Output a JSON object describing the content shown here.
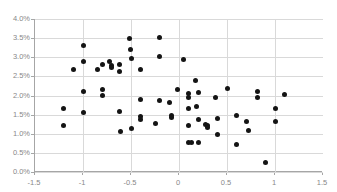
{
  "chart_data": {
    "type": "scatter",
    "title": "",
    "xlabel": "",
    "ylabel": "",
    "xlim": [
      -1.5,
      1.5
    ],
    "ylim": [
      0.0,
      4.0
    ],
    "grid": true,
    "legend": null,
    "y_unit": "%",
    "xticks": [
      -1.5,
      -1,
      -0.5,
      0,
      0.5,
      1,
      1.5
    ],
    "xtick_labels": [
      "-1.5",
      "-1",
      "-0.5",
      "0",
      "0.5",
      "1",
      "1.5"
    ],
    "yticks": [
      0.0,
      0.5,
      1.0,
      1.5,
      2.0,
      2.5,
      3.0,
      3.5,
      4.0
    ],
    "ytick_labels": [
      "0.0%",
      "0.5%",
      "1.0%",
      "1.5%",
      "2.0%",
      "2.5%",
      "3.0%",
      "3.5%",
      "4.0%"
    ],
    "marker": "circle",
    "marker_color": "#141414",
    "grid_color": "#d9d9d9",
    "axis_color": "#a6a6a6",
    "points": [
      [
        -1.2,
        1.65
      ],
      [
        -1.2,
        1.22
      ],
      [
        -1.1,
        2.68
      ],
      [
        -1.0,
        3.32
      ],
      [
        -1.0,
        2.88
      ],
      [
        -1.0,
        2.11
      ],
      [
        -1.0,
        1.56
      ],
      [
        -0.85,
        2.69
      ],
      [
        -0.8,
        2.8
      ],
      [
        -0.8,
        2.15
      ],
      [
        -0.8,
        2.0
      ],
      [
        -0.72,
        2.9
      ],
      [
        -0.7,
        2.78
      ],
      [
        -0.7,
        2.72
      ],
      [
        -0.62,
        2.82
      ],
      [
        -0.62,
        2.62
      ],
      [
        -0.62,
        1.57
      ],
      [
        -0.61,
        1.07
      ],
      [
        -0.52,
        3.49
      ],
      [
        -0.51,
        3.21
      ],
      [
        -0.5,
        2.98
      ],
      [
        -0.5,
        1.14
      ],
      [
        -0.4,
        2.68
      ],
      [
        -0.4,
        1.9
      ],
      [
        -0.4,
        1.45
      ],
      [
        -0.4,
        1.38
      ],
      [
        -0.25,
        1.28
      ],
      [
        -0.2,
        3.51
      ],
      [
        -0.2,
        3.02
      ],
      [
        -0.2,
        1.88
      ],
      [
        -0.1,
        1.81
      ],
      [
        -0.08,
        1.48
      ],
      [
        -0.08,
        1.42
      ],
      [
        -0.02,
        2.16
      ],
      [
        0.05,
        2.94
      ],
      [
        0.1,
        2.06
      ],
      [
        0.1,
        1.96
      ],
      [
        0.1,
        1.66
      ],
      [
        0.1,
        1.21
      ],
      [
        0.1,
        0.78
      ],
      [
        0.13,
        0.78
      ],
      [
        0.17,
        2.38
      ],
      [
        0.18,
        1.71
      ],
      [
        0.2,
        2.09
      ],
      [
        0.2,
        1.37
      ],
      [
        0.2,
        0.78
      ],
      [
        0.28,
        1.25
      ],
      [
        0.3,
        1.21
      ],
      [
        0.3,
        1.17
      ],
      [
        0.38,
        1.94
      ],
      [
        0.4,
        1.4
      ],
      [
        0.4,
        0.98
      ],
      [
        0.5,
        2.18
      ],
      [
        0.6,
        1.48
      ],
      [
        0.6,
        0.72
      ],
      [
        0.7,
        1.31
      ],
      [
        0.72,
        1.08
      ],
      [
        0.82,
        2.1
      ],
      [
        0.82,
        1.94
      ],
      [
        0.9,
        0.26
      ],
      [
        1.0,
        1.67
      ],
      [
        1.0,
        1.31
      ],
      [
        1.1,
        2.03
      ]
    ]
  }
}
